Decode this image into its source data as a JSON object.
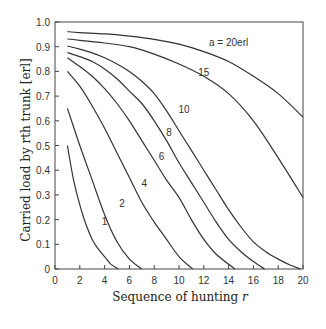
{
  "chart_data": {
    "type": "line",
    "title": "",
    "xlabel": "Sequence of hunting r",
    "ylabel": "Carried load by rth trunk [erl]",
    "xlim": [
      0,
      20
    ],
    "ylim": [
      0,
      1.0
    ],
    "xticks": [
      0,
      2,
      4,
      6,
      8,
      10,
      12,
      14,
      16,
      18,
      20
    ],
    "yticks": [
      0,
      0.1,
      0.2,
      0.3,
      0.4,
      0.5,
      0.6,
      0.7,
      0.8,
      0.9,
      1.0
    ],
    "ytick_labels": [
      "0",
      "0.1",
      "0.2",
      "0.3",
      "0.4",
      "0.5",
      "0.6",
      "0.7",
      "0.8",
      "0.9",
      "1.0"
    ],
    "grid": false,
    "legend": "inline curve labels",
    "annotation": "a = 20erl",
    "series": [
      {
        "name": "1",
        "x": [
          1,
          1.5,
          2,
          2.5,
          3,
          3.5,
          4,
          4.5,
          5.1
        ],
        "values": [
          0.5,
          0.36,
          0.26,
          0.18,
          0.12,
          0.08,
          0.05,
          0.02,
          0.0
        ],
        "label_pos": [
          4.0,
          0.18
        ]
      },
      {
        "name": "2",
        "x": [
          1,
          2,
          3,
          4,
          5,
          6,
          7
        ],
        "values": [
          0.65,
          0.5,
          0.36,
          0.22,
          0.11,
          0.04,
          0.0
        ],
        "label_pos": [
          5.4,
          0.25
        ]
      },
      {
        "name": "4",
        "x": [
          1,
          2,
          3,
          4,
          5,
          6,
          7,
          8,
          9,
          10,
          11.1
        ],
        "values": [
          0.8,
          0.74,
          0.66,
          0.57,
          0.47,
          0.37,
          0.27,
          0.19,
          0.12,
          0.05,
          0.0
        ],
        "label_pos": [
          7.2,
          0.33
        ]
      },
      {
        "name": "6",
        "x": [
          1,
          2,
          3,
          4,
          5,
          6,
          7,
          8,
          9,
          10,
          11,
          12,
          13,
          14.5
        ],
        "values": [
          0.855,
          0.82,
          0.78,
          0.73,
          0.67,
          0.6,
          0.52,
          0.44,
          0.36,
          0.29,
          0.2,
          0.12,
          0.06,
          0.0
        ],
        "label_pos": [
          8.6,
          0.44
        ]
      },
      {
        "name": "8",
        "x": [
          1,
          2,
          3,
          4,
          5,
          6,
          7,
          8,
          9,
          10,
          11,
          12,
          13,
          14,
          15,
          16,
          16.9
        ],
        "values": [
          0.876,
          0.86,
          0.84,
          0.81,
          0.77,
          0.72,
          0.67,
          0.6,
          0.52,
          0.43,
          0.35,
          0.27,
          0.19,
          0.12,
          0.07,
          0.03,
          0.0
        ],
        "label_pos": [
          9.2,
          0.54
        ]
      },
      {
        "name": "10",
        "x": [
          1,
          2,
          3,
          4,
          5,
          6,
          7,
          8,
          9,
          10,
          11,
          12,
          13,
          14,
          15,
          16,
          17,
          18,
          19,
          19.8
        ],
        "values": [
          0.903,
          0.89,
          0.875,
          0.855,
          0.83,
          0.8,
          0.76,
          0.71,
          0.64,
          0.56,
          0.48,
          0.4,
          0.32,
          0.24,
          0.17,
          0.11,
          0.07,
          0.04,
          0.015,
          0.0
        ],
        "label_pos": [
          10.4,
          0.63
        ]
      },
      {
        "name": "15",
        "x": [
          1,
          2,
          4,
          6,
          8,
          10,
          12,
          14,
          16,
          18,
          20
        ],
        "values": [
          0.931,
          0.926,
          0.915,
          0.9,
          0.87,
          0.83,
          0.78,
          0.71,
          0.6,
          0.45,
          0.29
        ],
        "label_pos": [
          12.0,
          0.78
        ]
      },
      {
        "name": "20",
        "x": [
          1,
          2,
          4,
          6,
          8,
          10,
          12,
          14,
          16,
          18,
          20
        ],
        "values": [
          0.961,
          0.957,
          0.952,
          0.943,
          0.93,
          0.91,
          0.88,
          0.84,
          0.78,
          0.71,
          0.615
        ],
        "label_pos": null
      }
    ]
  },
  "labels": {
    "annotation": "a = 20erl",
    "xlabel_text": "Sequence of hunting ",
    "xlabel_var": "r",
    "ylabel_text": "Carried load by rth trunk [erl]"
  }
}
